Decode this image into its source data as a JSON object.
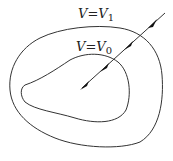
{
  "diagram": {
    "outer_label": {
      "var": "V",
      "eq": "=",
      "rhs": "V",
      "sub": "1"
    },
    "inner_label": {
      "var": "V",
      "eq": "=",
      "rhs": "V",
      "sub": "0"
    },
    "stroke_color": "#333333"
  }
}
